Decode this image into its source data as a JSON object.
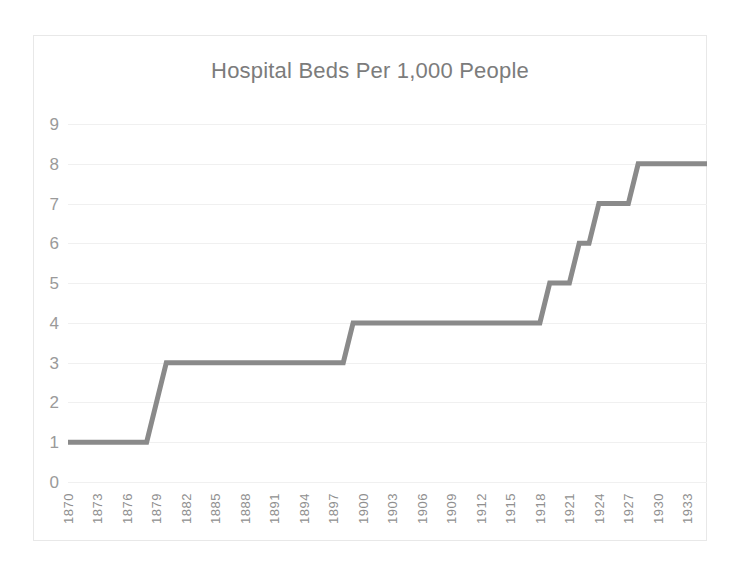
{
  "chart_data": {
    "type": "line",
    "title": "Hospital Beds Per 1,000 People",
    "xlabel": "",
    "ylabel": "",
    "line_style": "step",
    "grid": true,
    "legend": "none",
    "series_color": "#8a8a8a",
    "gridline_color": "#f0f0f0",
    "axis_text_color": "#9a9a9a",
    "title_color": "#7c7c7c",
    "xlim": [
      1870,
      1935
    ],
    "ylim": [
      0,
      9
    ],
    "ytick_labels": [
      "9",
      "8",
      "7",
      "6",
      "5",
      "4",
      "3",
      "2",
      "1",
      "0"
    ],
    "ytick_values": [
      9,
      8,
      7,
      6,
      5,
      4,
      3,
      2,
      1,
      0
    ],
    "xtick_labels": [
      "1870",
      "1873",
      "1876",
      "1879",
      "1882",
      "1885",
      "1888",
      "1891",
      "1894",
      "1897",
      "1900",
      "1903",
      "1906",
      "1909",
      "1912",
      "1915",
      "1918",
      "1921",
      "1924",
      "1927",
      "1930",
      "1933"
    ],
    "xtick_values": [
      1870,
      1873,
      1876,
      1879,
      1882,
      1885,
      1888,
      1891,
      1894,
      1897,
      1900,
      1903,
      1906,
      1909,
      1912,
      1915,
      1918,
      1921,
      1924,
      1927,
      1930,
      1933
    ],
    "x": [
      1870,
      1878,
      1880,
      1898,
      1899,
      1918,
      1919,
      1921,
      1922,
      1923,
      1924,
      1927,
      1928,
      1935
    ],
    "values": [
      1,
      1,
      3,
      3,
      4,
      4,
      5,
      5,
      6,
      6,
      7,
      7,
      8,
      8
    ],
    "series": [
      {
        "name": "Hospital Beds Per 1,000 People",
        "x": [
          1870,
          1878,
          1880,
          1898,
          1899,
          1918,
          1919,
          1921,
          1922,
          1923,
          1924,
          1927,
          1928,
          1935
        ],
        "values": [
          1,
          1,
          3,
          3,
          4,
          4,
          5,
          5,
          6,
          6,
          7,
          7,
          8,
          8
        ]
      }
    ],
    "annotations": []
  }
}
